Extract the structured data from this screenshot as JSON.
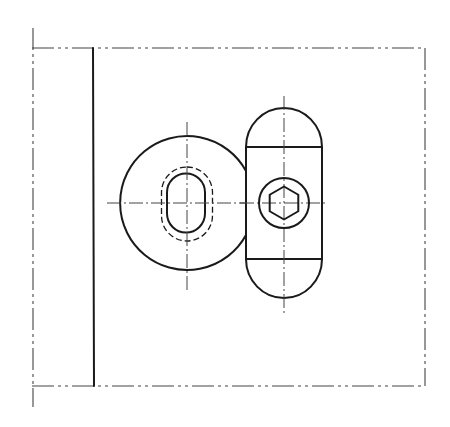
{
  "drawing": {
    "type": "technical-drawing",
    "description": "Orthographic view of a round part with oval slot next to a capsule-shaped block with a socket-head screw, inside a phantom boundary",
    "colors": {
      "background": "#ffffff",
      "line": "#1a1a1a",
      "centerline": "#444444"
    },
    "frame": {
      "left": 32,
      "top": 48,
      "right": 425,
      "bottom": 386,
      "left_ext_top": 28,
      "left_ext_bottom": 407,
      "wall_x": 93
    },
    "round_part": {
      "cx": 187,
      "cy": 203,
      "r": 67,
      "slot": {
        "cx": 186,
        "cy": 203,
        "w": 38,
        "h": 59
      },
      "slot_hidden": {
        "cx": 187,
        "cy": 204,
        "w": 51,
        "h": 74
      }
    },
    "capsule": {
      "left": 246,
      "right": 322,
      "top": 108,
      "bottom": 298,
      "upper_line": 147,
      "lower_line": 259,
      "cx": 284
    },
    "screw": {
      "cx": 284,
      "cy": 203,
      "r": 25,
      "hex_r": 16.5
    }
  }
}
